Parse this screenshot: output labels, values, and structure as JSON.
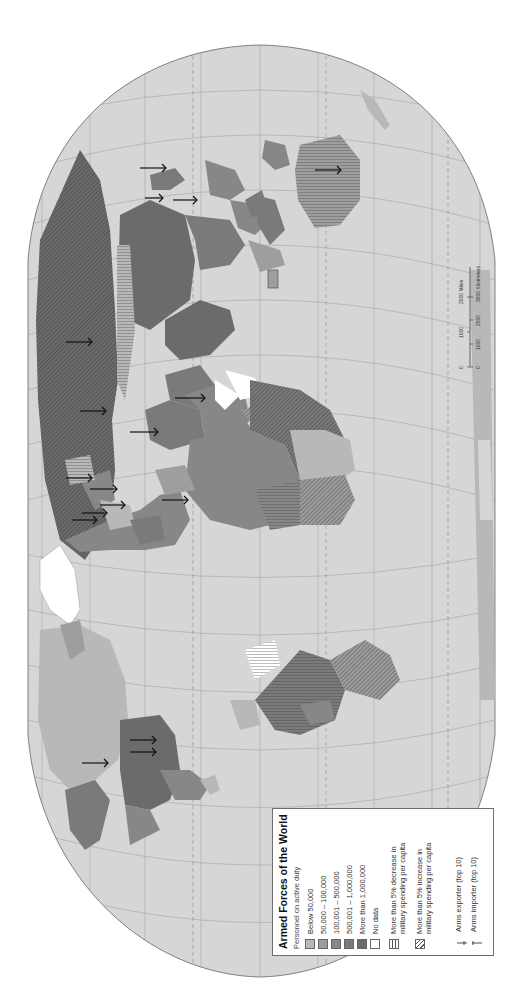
{
  "map": {
    "projection": "Robinson (rotated 90°)",
    "colors": {
      "ocean": "#d6d6d6",
      "below_50000": "#b8b8b8",
      "50000_100000": "#9e9e9e",
      "100001_500000": "#878787",
      "500001_1000000": "#7a7a7a",
      "more_than_1000000": "#6b6b6b",
      "no_data": "#ffffff",
      "graticule": "#9a9a9a",
      "border": "#555555"
    }
  },
  "legend": {
    "title": "Armed Forces of the World",
    "subtitle": "Personnel on active duty",
    "items": [
      {
        "label": "Below 50,000",
        "color": "#b8b8b8"
      },
      {
        "label": "50,000 – 100,000",
        "color": "#9e9e9e"
      },
      {
        "label": "100,001 – 500,000",
        "color": "#878787"
      },
      {
        "label": "500,001 – 1,000,000",
        "color": "#7a7a7a"
      },
      {
        "label": "More than 1,000,000",
        "color": "#6b6b6b"
      },
      {
        "label": "No data",
        "color": "#ffffff"
      }
    ],
    "patterns": [
      {
        "label": "More than 5% decrease in military spending per capita",
        "pattern": "vertical-lines"
      },
      {
        "label": "More than 5% increase in military spending per capita",
        "pattern": "diagonal-lines"
      }
    ],
    "symbols": [
      {
        "label": "Arms exporter (top 10)",
        "symbol": "arrow-exporter"
      },
      {
        "label": "Arms importer (top 10)",
        "symbol": "arrow-importer"
      }
    ]
  },
  "scale": {
    "miles_ticks": [
      "0",
      "1000",
      "2000 Miles"
    ],
    "km_ticks": [
      "0",
      "1000",
      "2000",
      "3000 Kilometers"
    ]
  }
}
